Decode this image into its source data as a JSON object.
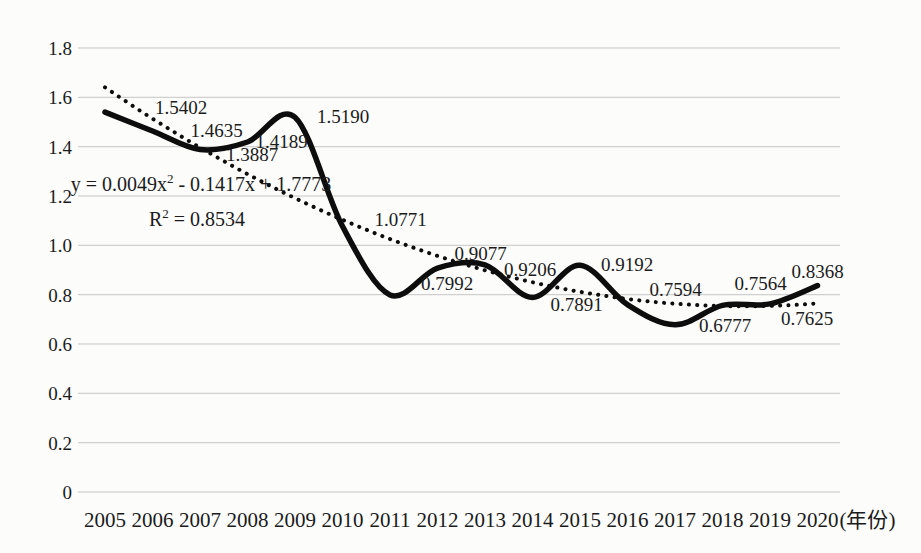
{
  "chart_data": {
    "type": "line",
    "title": "",
    "xlabel": "",
    "ylabel": "",
    "x_axis_suffix": "(年份)",
    "ylim": [
      0,
      1.8
    ],
    "ytick_step": 0.2,
    "y_tick_labels": [
      "1.8",
      "1.6",
      "1.4",
      "1.2",
      "1.0",
      "0.8",
      "0.6",
      "0.4",
      "0.2",
      "0"
    ],
    "categories": [
      "2005",
      "2006",
      "2007",
      "2008",
      "2009",
      "2010",
      "2011",
      "2012",
      "2013",
      "2014",
      "2015",
      "2016",
      "2017",
      "2018",
      "2019",
      "2020"
    ],
    "series": [
      {
        "name": "observed-smooth-line",
        "style": "solid-smooth",
        "values": [
          1.5402,
          1.4635,
          1.3887,
          1.4189,
          1.519,
          1.0771,
          0.7992,
          0.9077,
          0.9206,
          0.7891,
          0.9192,
          0.7594,
          0.6777,
          0.7564,
          0.7625,
          0.8368
        ]
      },
      {
        "name": "polynomial-trendline",
        "style": "dotted",
        "equation_coeffs": [
          0.0049,
          -0.1417,
          1.7773
        ]
      }
    ],
    "points": [
      {
        "year": "2005",
        "value": 1.5402,
        "label": "1.5402",
        "dx": 76,
        "dy": -4
      },
      {
        "year": "2006",
        "value": 1.4635,
        "label": "1.4635",
        "dx": 64,
        "dy": 0
      },
      {
        "year": "2007",
        "value": 1.3887,
        "label": "1.3887",
        "dx": 52,
        "dy": 5
      },
      {
        "year": "2008",
        "value": 1.4189,
        "label": "1.4189",
        "dx": 34,
        "dy": 0
      },
      {
        "year": "2009",
        "value": 1.519,
        "label": "1.5190",
        "dx": 48,
        "dy": 0
      },
      {
        "year": "2010",
        "value": 1.0771,
        "label": "1.0771",
        "dx": 58,
        "dy": -6
      },
      {
        "year": "2011",
        "value": 0.7992,
        "label": "0.7992",
        "dx": 57,
        "dy": -11
      },
      {
        "year": "2012",
        "value": 0.9077,
        "label": "0.9077",
        "dx": 43,
        "dy": -14
      },
      {
        "year": "2013",
        "value": 0.9206,
        "label": "0.9206",
        "dx": 45,
        "dy": 5
      },
      {
        "year": "2014",
        "value": 0.7891,
        "label": "0.7891",
        "dx": 44,
        "dy": 8
      },
      {
        "year": "2015",
        "value": 0.9192,
        "label": "0.9192",
        "dx": 47,
        "dy": 0
      },
      {
        "year": "2016",
        "value": 0.7594,
        "label": "0.7594",
        "dx": 48,
        "dy": -15
      },
      {
        "year": "2017",
        "value": 0.6777,
        "label": "0.6777",
        "dx": 50,
        "dy": 1
      },
      {
        "year": "2018",
        "value": 0.7564,
        "label": "0.7564",
        "dx": 38,
        "dy": -21
      },
      {
        "year": "2019",
        "value": 0.7625,
        "label": "0.7625",
        "dx": 37,
        "dy": 15
      },
      {
        "year": "2020",
        "value": 0.8368,
        "label": "0.8368",
        "dx": 0,
        "dy": -14
      }
    ],
    "annotations": {
      "equation": {
        "pre": "y = 0.0049x",
        "sup": "2",
        "post": " - 0.1417x + 1.7773",
        "x": 201,
        "y": 191
      },
      "r_squared": {
        "pre": "R",
        "sup": "2",
        "post": " = 0.8534",
        "x": 197,
        "y": 226
      }
    },
    "layout": {
      "width": 921,
      "height": 553,
      "plot": {
        "x_left": 78,
        "x_right": 840,
        "y_top": 48,
        "y_bottom": 492
      },
      "x_start": 105,
      "x_step": 47.5,
      "x_tick_baseline": 527,
      "grid": "on",
      "legend": "none",
      "colors": {
        "line": "#0d0d0d",
        "trendline": "#0d0d0d",
        "grid": "#c5c5c5",
        "text": "#1b1b1b",
        "background": "#fcfcfb"
      },
      "font_sizes": {
        "point_label": 19,
        "y_tick": 19,
        "x_tick": 21,
        "equation": 20,
        "sup": 13
      }
    }
  }
}
